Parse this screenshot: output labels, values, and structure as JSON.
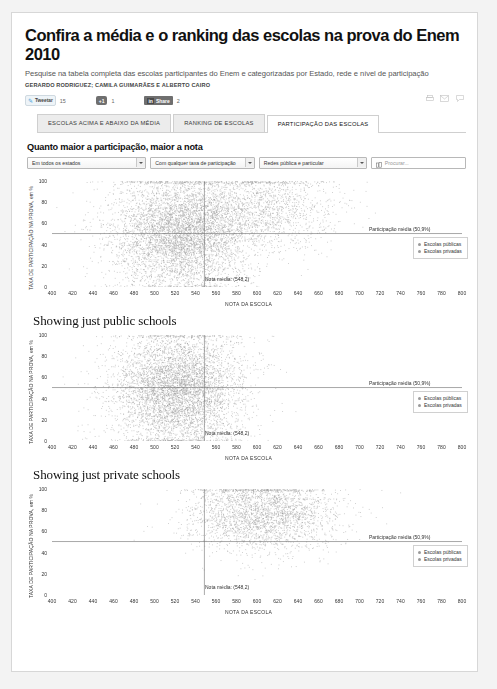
{
  "article": {
    "title": "Confira a média e o ranking das escolas na prova do Enem 2010",
    "subtitle": "Pesquise na tabela completa das escolas participantes do Enem e categorizadas por Estado, rede e nível de participação",
    "byline": "GERARDO RODRIGUEZ; CAMILA GUIMARÃES E ALBERTO CAIRO"
  },
  "social": {
    "tweet_label": "Tweetar",
    "tweet_count": "15",
    "gplus_label": "+1",
    "gplus_count": "1",
    "linkedin_brand": "in",
    "linkedin_label": "Share",
    "linkedin_count": "2",
    "tools": [
      "print-icon",
      "email-icon",
      "comment-icon"
    ]
  },
  "tabs": [
    {
      "label": "ESCOLAS ACIMA E ABAIXO DA MÉDIA",
      "active": false
    },
    {
      "label": "RANKING DE ESCOLAS",
      "active": false
    },
    {
      "label": "PARTICIPAÇÃO DAS ESCOLAS",
      "active": true
    }
  ],
  "section": {
    "title": "Quanto maior a participação, maior a nota"
  },
  "filters": {
    "state": "Em todos os estados",
    "participation": "Com qualquer taxa de participação",
    "network": "Redes pública e particular",
    "search_placeholder": "Procurar...",
    "search_value": "",
    "search_icon": "building-icon"
  },
  "chart_data": [
    {
      "type": "scatter",
      "title": "",
      "xlabel": "NOTA DA ESCOLA",
      "ylabel": "TAXA DE PARTICIPAÇÃO NA PROVA, em %",
      "xlim": [
        400,
        800
      ],
      "ylim": [
        0,
        100
      ],
      "xticks": [
        400,
        420,
        440,
        460,
        480,
        500,
        520,
        540,
        560,
        580,
        600,
        620,
        640,
        660,
        680,
        700,
        720,
        740,
        760,
        780,
        800
      ],
      "yticks": [
        0,
        20,
        40,
        60,
        80,
        100
      ],
      "grid": false,
      "series": [
        {
          "name": "Escolas públicas",
          "color": "#9a9a9a",
          "center_x": 525,
          "center_y": 52,
          "spread_x": 33,
          "spread_y": 27,
          "n": 5200
        },
        {
          "name": "Escolas privadas",
          "color": "#9a9a9a",
          "center_x": 605,
          "center_y": 74,
          "spread_x": 36,
          "spread_y": 20,
          "n": 1500
        }
      ],
      "reference_lines": [
        {
          "axis": "y",
          "value": 50.9,
          "label": "Participação média (50,9%)"
        },
        {
          "axis": "x",
          "value": 548.2,
          "label": "Nota média: (548,2)"
        }
      ],
      "legend": {
        "position": "right",
        "entries": [
          "Escolas públicas",
          "Escolas privadas"
        ]
      }
    },
    {
      "type": "scatter",
      "title": "Showing just public schools",
      "xlabel": "NOTA DA ESCOLA",
      "ylabel": "TAXA DE PARTICIPAÇÃO NA PROVA, em %",
      "xlim": [
        400,
        800
      ],
      "ylim": [
        0,
        100
      ],
      "xticks": [
        400,
        420,
        440,
        460,
        480,
        500,
        520,
        540,
        560,
        580,
        600,
        620,
        640,
        660,
        680,
        700,
        720,
        740,
        760,
        780,
        800
      ],
      "yticks": [
        0,
        20,
        40,
        60,
        80,
        100
      ],
      "grid": false,
      "series": [
        {
          "name": "Escolas públicas",
          "color": "#9a9a9a",
          "center_x": 522,
          "center_y": 50,
          "spread_x": 32,
          "spread_y": 27,
          "n": 5200
        }
      ],
      "reference_lines": [
        {
          "axis": "y",
          "value": 50.9,
          "label": "Participação média (50,9%)"
        },
        {
          "axis": "x",
          "value": 548.2,
          "label": "Nota média: (548,2)"
        }
      ],
      "legend": {
        "position": "right",
        "entries": [
          "Escolas públicas",
          "Escolas privadas"
        ]
      }
    },
    {
      "type": "scatter",
      "title": "Showing just private schools",
      "xlabel": "NOTA DA ESCOLA",
      "ylabel": "TAXA DE PARTICIPAÇÃO NA PROVA, em %",
      "xlim": [
        400,
        800
      ],
      "ylim": [
        0,
        100
      ],
      "xticks": [
        400,
        420,
        440,
        460,
        480,
        500,
        520,
        540,
        560,
        580,
        600,
        620,
        640,
        660,
        680,
        700,
        720,
        740,
        760,
        780,
        800
      ],
      "yticks": [
        0,
        20,
        40,
        60,
        80,
        100
      ],
      "grid": false,
      "series": [
        {
          "name": "Escolas privadas",
          "color": "#9a9a9a",
          "center_x": 605,
          "center_y": 76,
          "spread_x": 36,
          "spread_y": 18,
          "n": 2600
        }
      ],
      "reference_lines": [
        {
          "axis": "y",
          "value": 50.9,
          "label": "Participação média (50,9%)"
        },
        {
          "axis": "x",
          "value": 548.2,
          "label": "Nota média: (548,2)"
        }
      ],
      "legend": {
        "position": "right",
        "entries": [
          "Escolas públicas",
          "Escolas privadas"
        ]
      }
    }
  ]
}
